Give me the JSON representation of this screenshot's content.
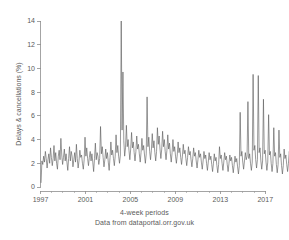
{
  "chart_data": {
    "type": "line",
    "title": "",
    "subtitle": "",
    "xlabel": "4-week periods",
    "ylabel": "Delays & cancellations (%)",
    "source_note": "Data from dataportal.orr.gov.uk",
    "xlim": [
      1997.0,
      2017.6
    ],
    "ylim": [
      0,
      14
    ],
    "yticks": [
      0,
      2,
      4,
      6,
      8,
      10,
      12,
      14
    ],
    "ytick_labels": [
      "0",
      "2",
      "4",
      "6",
      "8",
      "10",
      "12",
      "14"
    ],
    "xticks": [
      1997,
      2001,
      2005,
      2009,
      2013,
      2017
    ],
    "xtick_labels": [
      "1997",
      "2001",
      "2005",
      "2009",
      "2013",
      "2017"
    ],
    "minor_xticks": [
      1998,
      1999,
      2000,
      2002,
      2003,
      2004,
      2006,
      2007,
      2008,
      2010,
      2011,
      2012,
      2014,
      2015,
      2016
    ],
    "grid": false,
    "legend": null,
    "series_color": "#595959",
    "axis_color": "#8d8d8d",
    "background_color": "#ffffff",
    "series": [
      {
        "name": "Delays & cancellations",
        "x_start": 1997.05,
        "x_step": 0.0767,
        "values": [
          0.35,
          2.2,
          1.9,
          2.6,
          2.1,
          3.0,
          2.4,
          1.6,
          2.3,
          2.8,
          2.0,
          3.3,
          2.5,
          1.8,
          2.4,
          3.5,
          2.2,
          2.9,
          2.0,
          1.5,
          2.6,
          3.1,
          2.3,
          4.1,
          2.7,
          1.9,
          2.5,
          3.2,
          2.2,
          2.8,
          2.1,
          1.4,
          2.4,
          3.4,
          2.2,
          3.0,
          2.6,
          1.7,
          2.3,
          2.9,
          2.1,
          3.6,
          2.4,
          1.6,
          2.2,
          3.1,
          2.5,
          2.7,
          2.0,
          1.5,
          2.3,
          4.2,
          2.6,
          3.3,
          2.4,
          1.8,
          2.5,
          3.0,
          2.2,
          2.8,
          2.1,
          1.3,
          2.4,
          3.7,
          2.3,
          2.9,
          2.6,
          1.9,
          2.4,
          5.1,
          2.8,
          3.4,
          2.5,
          1.7,
          2.3,
          3.2,
          2.4,
          2.9,
          2.1,
          1.4,
          2.5,
          3.8,
          2.7,
          3.1,
          2.4,
          1.8,
          2.6,
          4.4,
          2.9,
          3.5,
          2.6,
          2.0,
          2.7,
          14.3,
          4.8,
          9.7,
          3.9,
          2.6,
          3.3,
          5.2,
          3.4,
          4.0,
          3.1,
          2.3,
          3.2,
          4.6,
          3.3,
          3.8,
          2.9,
          2.2,
          3.0,
          4.3,
          3.2,
          3.6,
          2.8,
          2.1,
          2.9,
          4.1,
          3.1,
          3.5,
          2.7,
          2.0,
          2.8,
          7.6,
          3.4,
          4.2,
          3.0,
          2.3,
          3.1,
          4.5,
          3.3,
          3.9,
          2.9,
          2.2,
          3.0,
          5.0,
          3.6,
          4.3,
          3.2,
          2.4,
          3.2,
          4.7,
          3.4,
          4.0,
          3.0,
          2.3,
          3.1,
          4.4,
          3.2,
          3.7,
          2.8,
          2.1,
          2.9,
          4.0,
          3.0,
          3.4,
          2.6,
          2.0,
          2.7,
          3.8,
          2.9,
          3.3,
          2.5,
          1.9,
          2.6,
          3.6,
          2.8,
          3.1,
          2.4,
          1.8,
          2.5,
          3.4,
          2.7,
          3.0,
          2.3,
          1.7,
          2.4,
          3.3,
          2.6,
          2.9,
          2.2,
          1.6,
          2.3,
          3.1,
          2.5,
          2.8,
          2.1,
          1.5,
          2.2,
          3.0,
          2.4,
          2.7,
          2.0,
          1.4,
          2.1,
          2.9,
          2.3,
          2.6,
          1.9,
          1.3,
          2.0,
          2.8,
          2.2,
          2.5,
          1.8,
          1.2,
          1.9,
          3.4,
          2.4,
          2.7,
          2.0,
          1.4,
          2.1,
          2.9,
          2.3,
          2.6,
          1.9,
          1.3,
          2.0,
          2.7,
          2.2,
          2.5,
          1.8,
          1.2,
          1.9,
          2.6,
          2.1,
          2.4,
          1.7,
          1.1,
          1.8,
          6.3,
          2.6,
          3.0,
          2.1,
          1.5,
          2.2,
          2.9,
          2.3,
          2.6,
          7.2,
          2.4,
          2.8,
          2.0,
          1.4,
          2.1,
          9.5,
          3.1,
          3.5,
          2.3,
          1.6,
          2.3,
          9.4,
          2.9,
          3.3,
          2.2,
          1.5,
          2.2,
          7.4,
          2.8,
          3.1,
          2.1,
          1.4,
          2.1,
          6.1,
          2.7,
          3.0,
          2.0,
          1.3,
          2.0,
          5.0,
          2.6,
          2.9,
          1.9,
          1.2,
          1.9,
          4.8,
          2.5,
          2.8,
          1.8,
          1.1,
          1.8,
          3.2,
          2.4,
          2.7,
          1.9,
          1.3,
          2.0,
          3.0,
          2.3,
          2.6,
          1.8,
          1.2,
          1.9,
          2.9,
          2.2,
          2.5,
          1.7,
          1.1,
          1.8,
          3.1,
          2.4,
          2.7,
          2.0,
          1.4,
          2.1,
          3.3,
          2.6,
          2.9,
          2.2,
          1.6,
          2.3,
          3.6,
          2.8,
          3.2,
          2.4,
          1.8,
          2.5,
          3.9,
          3.0,
          3.4,
          2.6,
          2.0,
          2.7,
          4.2,
          3.2,
          3.6,
          2.8,
          2.1,
          2.8,
          7.1,
          3.4,
          3.8,
          2.9,
          2.2,
          3.0,
          4.5,
          3.3,
          3.7,
          2.8,
          2.1,
          2.9,
          4.3,
          3.2,
          3.6,
          2.7,
          2.0,
          2.8,
          4.6,
          3.4,
          3.8,
          2.9,
          2.2,
          3.0,
          4.4,
          3.3,
          3.7,
          2.8,
          2.1,
          2.9,
          4.7,
          3.5,
          3.9,
          3.0,
          2.3,
          3.1,
          4.8,
          3.6,
          4.0,
          3.1,
          2.4,
          3.2,
          5.0,
          3.7,
          4.1,
          3.2,
          2.4,
          3.3,
          6.6,
          4.2,
          4.6,
          3.5,
          2.7,
          3.6,
          7.8,
          5.1,
          4.9,
          3.8,
          3.0,
          3.9,
          5.3,
          4.4,
          4.7,
          3.9,
          3.2,
          4.0,
          5.1,
          4.3,
          4.5,
          3.7,
          2.9,
          3.8,
          4.9,
          4.2,
          4.4,
          3.6,
          2.5
        ]
      }
    ]
  }
}
